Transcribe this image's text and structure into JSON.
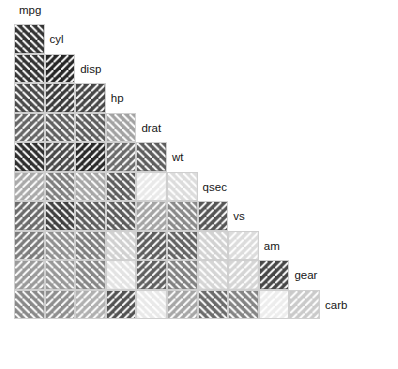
{
  "figure": {
    "title": "",
    "caption": "",
    "background_color": "#ffffff",
    "cell_border_color": "#cfcfcf",
    "hatch_color": "#ffffff",
    "label_color": "#161616"
  },
  "chart_data": {
    "type": "heatmap",
    "title": "",
    "subtitle": "",
    "xlabel": "",
    "ylabel": "",
    "legend": "",
    "grid": true,
    "layout": "lower-triangular correlation matrix",
    "encoding": {
      "shade": "darker grey = larger absolute correlation, lighter grey = near zero",
      "hatch_direction": "down-right diagonals = negative correlation, up-right diagonals = positive correlation"
    },
    "categories": [
      "mpg",
      "cyl",
      "disp",
      "hp",
      "drat",
      "wt",
      "qsec",
      "vs",
      "am",
      "gear",
      "carb"
    ],
    "variables": [
      "mpg",
      "cyl",
      "disp",
      "hp",
      "drat",
      "wt",
      "qsec",
      "vs",
      "am",
      "gear",
      "carb"
    ],
    "matrix": [
      [
        1.0,
        -0.85,
        -0.85,
        -0.78,
        0.68,
        -0.87,
        0.42,
        0.66,
        0.6,
        0.48,
        -0.55
      ],
      [
        -0.85,
        1.0,
        0.9,
        0.83,
        -0.7,
        0.78,
        -0.59,
        -0.81,
        -0.52,
        -0.49,
        0.53
      ],
      [
        -0.85,
        0.9,
        1.0,
        0.79,
        -0.71,
        0.89,
        -0.43,
        -0.71,
        -0.59,
        -0.56,
        0.39
      ],
      [
        -0.78,
        0.83,
        0.79,
        1.0,
        -0.45,
        0.66,
        -0.71,
        -0.72,
        -0.24,
        -0.13,
        0.75
      ],
      [
        0.68,
        -0.7,
        -0.71,
        -0.45,
        1.0,
        -0.71,
        0.09,
        0.44,
        0.71,
        0.7,
        -0.09
      ],
      [
        -0.87,
        0.78,
        0.89,
        0.66,
        -0.71,
        1.0,
        -0.17,
        -0.55,
        -0.69,
        -0.58,
        0.43
      ],
      [
        0.42,
        -0.59,
        -0.43,
        -0.71,
        0.09,
        -0.17,
        1.0,
        0.74,
        -0.23,
        -0.21,
        -0.66
      ],
      [
        0.66,
        -0.81,
        -0.71,
        -0.72,
        0.44,
        -0.55,
        0.74,
        1.0,
        0.17,
        0.21,
        -0.57
      ],
      [
        0.6,
        -0.52,
        -0.59,
        -0.24,
        0.71,
        -0.69,
        -0.23,
        0.17,
        1.0,
        0.79,
        0.06
      ],
      [
        0.48,
        -0.49,
        -0.56,
        -0.13,
        0.7,
        -0.58,
        -0.21,
        0.21,
        0.79,
        1.0,
        0.27
      ],
      [
        -0.55,
        0.53,
        0.39,
        0.75,
        -0.09,
        0.43,
        -0.66,
        -0.57,
        0.06,
        0.27,
        1.0
      ]
    ]
  },
  "labels": [
    {
      "name": "mpg",
      "text": "mpg"
    },
    {
      "name": "cyl",
      "text": "cyl"
    },
    {
      "name": "disp",
      "text": "disp"
    },
    {
      "name": "hp",
      "text": "hp"
    },
    {
      "name": "drat",
      "text": "drat"
    },
    {
      "name": "wt",
      "text": "wt"
    },
    {
      "name": "qsec",
      "text": "qsec"
    },
    {
      "name": "vs",
      "text": "vs"
    },
    {
      "name": "am",
      "text": "am"
    },
    {
      "name": "gear",
      "text": "gear"
    },
    {
      "name": "carb",
      "text": "carb"
    }
  ]
}
